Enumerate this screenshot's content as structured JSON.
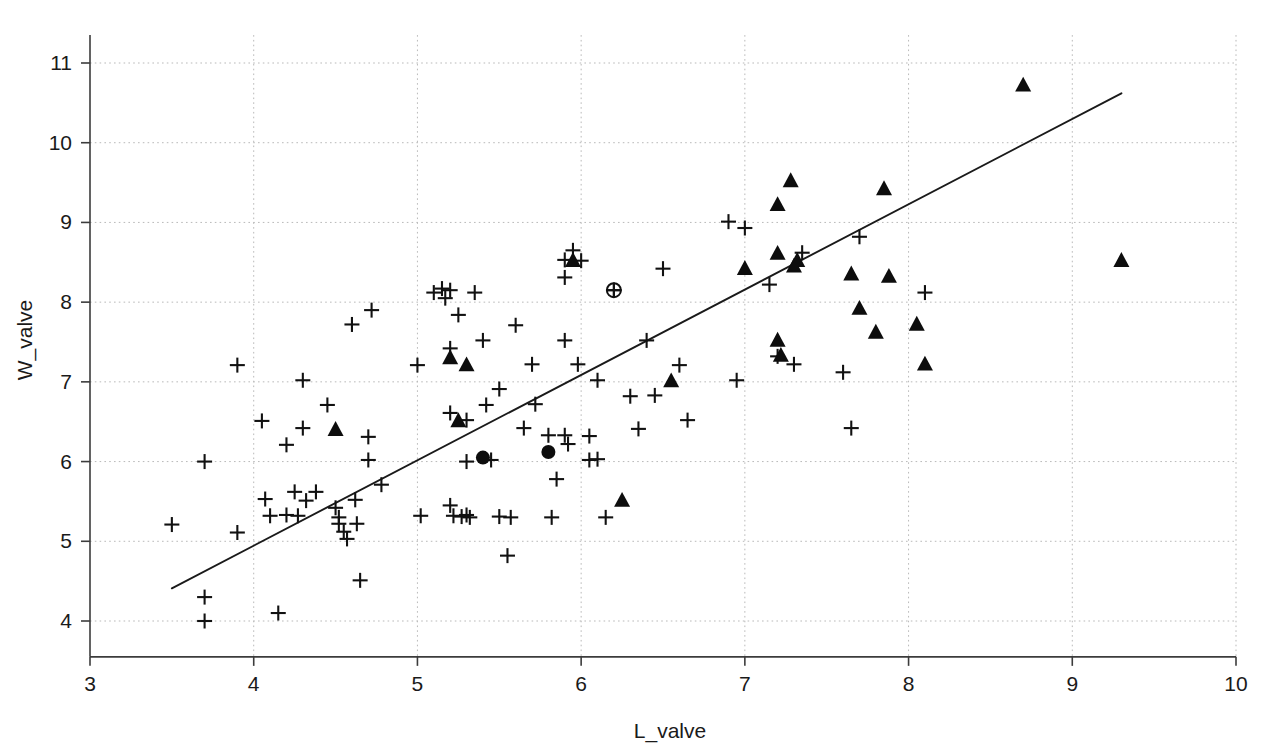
{
  "chart_data": {
    "type": "scatter",
    "title": "",
    "xlabel": "L_valve",
    "ylabel": "W_valve",
    "xlim": [
      3,
      10
    ],
    "ylim": [
      3.55,
      11.35
    ],
    "grid": true,
    "legend": null,
    "x_ticks": [
      "3",
      "4",
      "5",
      "6",
      "7",
      "8",
      "9",
      "10"
    ],
    "x_tick_values": [
      3,
      4,
      5,
      6,
      7,
      8,
      9,
      10
    ],
    "y_ticks": [
      "4",
      "5",
      "6",
      "7",
      "8",
      "9",
      "10",
      "11"
    ],
    "y_tick_values": [
      4,
      5,
      6,
      7,
      8,
      9,
      10,
      11
    ],
    "gridline_x_values": [
      4,
      5,
      6,
      7,
      8,
      9,
      10
    ],
    "gridline_y_values": [
      4,
      5,
      6,
      7,
      8,
      9,
      10,
      11
    ],
    "trend_line": {
      "name": "linear fit",
      "x_start": 3.5,
      "y_start": 4.41,
      "x_end": 9.3,
      "y_end": 10.62,
      "slope": 1.071,
      "intercept": 0.66
    },
    "series": [
      {
        "name": "plus-markers",
        "marker": "plus",
        "points": [
          [
            3.5,
            5.21
          ],
          [
            3.7,
            4.3
          ],
          [
            3.7,
            6.0
          ],
          [
            3.7,
            4.0
          ],
          [
            3.9,
            7.21
          ],
          [
            3.9,
            5.11
          ],
          [
            4.05,
            6.51
          ],
          [
            4.07,
            5.53
          ],
          [
            4.1,
            5.32
          ],
          [
            4.15,
            4.1
          ],
          [
            4.2,
            6.21
          ],
          [
            4.2,
            5.33
          ],
          [
            4.25,
            5.62
          ],
          [
            4.27,
            5.32
          ],
          [
            4.3,
            6.42
          ],
          [
            4.3,
            7.02
          ],
          [
            4.32,
            5.51
          ],
          [
            4.38,
            5.62
          ],
          [
            4.45,
            6.71
          ],
          [
            4.5,
            5.42
          ],
          [
            4.52,
            5.3
          ],
          [
            4.52,
            5.22
          ],
          [
            4.55,
            5.12
          ],
          [
            4.57,
            5.03
          ],
          [
            4.6,
            7.72
          ],
          [
            4.62,
            5.52
          ],
          [
            4.63,
            5.22
          ],
          [
            4.65,
            4.51
          ],
          [
            4.7,
            6.31
          ],
          [
            4.7,
            6.02
          ],
          [
            4.72,
            7.9
          ],
          [
            4.78,
            5.71
          ],
          [
            5.0,
            7.21
          ],
          [
            5.02,
            5.32
          ],
          [
            5.1,
            8.12
          ],
          [
            5.15,
            8.17
          ],
          [
            5.17,
            8.05
          ],
          [
            5.2,
            8.15
          ],
          [
            5.2,
            7.42
          ],
          [
            5.2,
            6.61
          ],
          [
            5.2,
            5.45
          ],
          [
            5.22,
            5.32
          ],
          [
            5.25,
            7.84
          ],
          [
            5.27,
            5.31
          ],
          [
            5.3,
            6.52
          ],
          [
            5.3,
            6.0
          ],
          [
            5.3,
            5.33
          ],
          [
            5.32,
            5.3
          ],
          [
            5.35,
            8.12
          ],
          [
            5.4,
            7.52
          ],
          [
            5.42,
            6.71
          ],
          [
            5.45,
            6.02
          ],
          [
            5.5,
            6.91
          ],
          [
            5.5,
            5.31
          ],
          [
            5.55,
            4.82
          ],
          [
            5.57,
            5.3
          ],
          [
            5.6,
            7.71
          ],
          [
            5.65,
            6.42
          ],
          [
            5.7,
            7.22
          ],
          [
            5.72,
            6.72
          ],
          [
            5.8,
            6.33
          ],
          [
            5.82,
            5.3
          ],
          [
            5.85,
            5.78
          ],
          [
            5.9,
            8.53
          ],
          [
            5.9,
            8.31
          ],
          [
            5.9,
            7.52
          ],
          [
            5.9,
            6.33
          ],
          [
            5.92,
            6.22
          ],
          [
            5.95,
            8.65
          ],
          [
            5.98,
            7.22
          ],
          [
            6.0,
            8.52
          ],
          [
            6.05,
            6.32
          ],
          [
            6.05,
            6.02
          ],
          [
            6.1,
            7.02
          ],
          [
            6.1,
            6.03
          ],
          [
            6.15,
            5.3
          ],
          [
            6.2,
            8.15
          ],
          [
            6.3,
            6.82
          ],
          [
            6.35,
            6.41
          ],
          [
            6.4,
            7.52
          ],
          [
            6.45,
            6.83
          ],
          [
            6.5,
            8.42
          ],
          [
            6.6,
            7.21
          ],
          [
            6.65,
            6.52
          ],
          [
            6.9,
            9.01
          ],
          [
            6.95,
            7.02
          ],
          [
            7.0,
            8.93
          ],
          [
            7.15,
            8.22
          ],
          [
            7.2,
            7.32
          ],
          [
            7.3,
            7.22
          ],
          [
            7.35,
            8.62
          ],
          [
            7.6,
            7.12
          ],
          [
            7.65,
            6.42
          ],
          [
            7.7,
            8.82
          ],
          [
            8.1,
            8.12
          ]
        ]
      },
      {
        "name": "triangle-markers",
        "marker": "triangle",
        "points": [
          [
            4.5,
            6.4
          ],
          [
            5.2,
            7.3
          ],
          [
            5.3,
            7.21
          ],
          [
            5.25,
            6.51
          ],
          [
            5.95,
            8.52
          ],
          [
            6.25,
            5.51
          ],
          [
            6.55,
            7.01
          ],
          [
            7.0,
            8.42
          ],
          [
            7.2,
            7.52
          ],
          [
            7.2,
            8.61
          ],
          [
            7.2,
            9.22
          ],
          [
            7.22,
            7.33
          ],
          [
            7.28,
            9.52
          ],
          [
            7.3,
            8.45
          ],
          [
            7.32,
            8.52
          ],
          [
            7.65,
            8.35
          ],
          [
            7.7,
            7.92
          ],
          [
            7.8,
            7.62
          ],
          [
            7.85,
            9.42
          ],
          [
            7.88,
            8.32
          ],
          [
            8.05,
            7.72
          ],
          [
            8.1,
            7.22
          ],
          [
            8.7,
            10.72
          ],
          [
            9.3,
            8.52
          ]
        ]
      },
      {
        "name": "filled-circle-markers",
        "marker": "circle-filled",
        "points": [
          [
            5.4,
            6.05
          ],
          [
            5.8,
            6.12
          ]
        ]
      },
      {
        "name": "circle-plus-markers",
        "marker": "circle-plus",
        "points": [
          [
            6.2,
            8.15
          ]
        ]
      }
    ]
  },
  "colors": {
    "marker": "#0d0d0d",
    "gridline": "#b9b9b9",
    "axis": "#3c3c3c",
    "fit_line": "#1a1a1a",
    "background": "#ffffff"
  }
}
